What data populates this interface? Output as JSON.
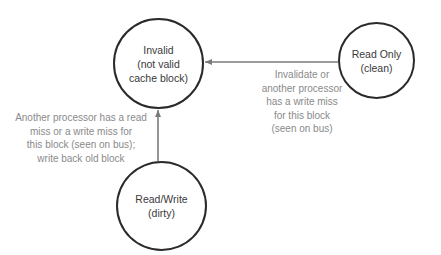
{
  "diagram": {
    "type": "state-transition",
    "states": [
      {
        "id": "invalid",
        "lines": [
          "Invalid",
          "(not valid",
          "cache block)"
        ]
      },
      {
        "id": "read_only",
        "lines": [
          "Read Only",
          "(clean)"
        ]
      },
      {
        "id": "read_write",
        "lines": [
          "Read/Write",
          "(dirty)"
        ]
      }
    ],
    "transitions": [
      {
        "from": "read_only",
        "to": "invalid",
        "label_lines": [
          "Invalidate or",
          "another processor",
          "has a write miss",
          "for this block",
          "(seen on bus)"
        ]
      },
      {
        "from": "read_write",
        "to": "invalid",
        "label_lines": [
          "Another processor has a read",
          "miss or a write miss for",
          "this block (seen on bus);",
          "write back old block"
        ]
      }
    ],
    "colors": {
      "state_border": "#2a2a2a",
      "state_text": "#3a3a3a",
      "arrow": "#7a7a7a",
      "label_text": "#8a8a8a",
      "background": "#ffffff"
    }
  }
}
